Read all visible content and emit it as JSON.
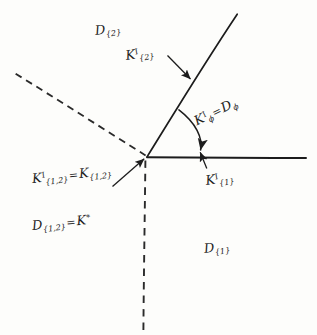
{
  "figure": {
    "background_color": "#fdfdfb",
    "ink_color": "#1c1c1c",
    "width": 317,
    "height": 335,
    "vertex": [
      147,
      157
    ]
  },
  "labels": {
    "d2": {
      "base": "D",
      "sub": "{2}",
      "x": 96,
      "y": 22
    },
    "k2": {
      "base": "K",
      "sup": "I",
      "sub": "{2}",
      "x": 127,
      "y": 47
    },
    "kphi": {
      "base": "K",
      "sup": "I",
      "sub": "ϕ",
      "eq": "=",
      "base2": "D",
      "sub2": "ϕ",
      "x": 199,
      "y": 112
    },
    "k12": {
      "base": "K",
      "sup": "I",
      "sub": "{1,2}",
      "eq": "=",
      "base2": "K",
      "sub2": "{1,2}",
      "x": 33,
      "y": 170
    },
    "k1": {
      "base": "K",
      "sup": "I",
      "sub": "{1}",
      "x": 207,
      "y": 172
    },
    "d12": {
      "base": "D",
      "sub": "{1,2}",
      "eq": "=",
      "base2": "K",
      "sup2": "*",
      "x": 33,
      "y": 217
    },
    "d1": {
      "base": "D",
      "sub": "{1}",
      "x": 205,
      "y": 240
    }
  },
  "geometry": {
    "rays": [
      {
        "name": "upper-right-solid",
        "style": "solid",
        "from": [
          147,
          157
        ],
        "to": [
          237,
          14
        ]
      },
      {
        "name": "right-horizontal-solid",
        "style": "solid",
        "from": [
          147,
          157
        ],
        "to": [
          306,
          158
        ]
      },
      {
        "name": "upper-left-dashed",
        "style": "dashed",
        "from": [
          145,
          155
        ],
        "to": [
          12,
          72
        ]
      },
      {
        "name": "down-vertical-dashed",
        "style": "dashed",
        "from": [
          145,
          160
        ],
        "to": [
          143,
          331
        ]
      }
    ],
    "angle_arc": {
      "name": "phi-angle-arc",
      "center": [
        147,
        157
      ],
      "radius": 57,
      "arrow": "end"
    },
    "leaders": [
      {
        "name": "leader-k2",
        "from": [
          168,
          56
        ],
        "to": [
          191,
          80
        ],
        "arrow": "end"
      },
      {
        "name": "leader-k12",
        "from": [
          113,
          186
        ],
        "to": [
          145,
          159
        ],
        "arrow": "end"
      },
      {
        "name": "leader-k1",
        "from": [
          207,
          168
        ],
        "to": [
          200,
          152
        ],
        "arrow": "end"
      }
    ]
  }
}
